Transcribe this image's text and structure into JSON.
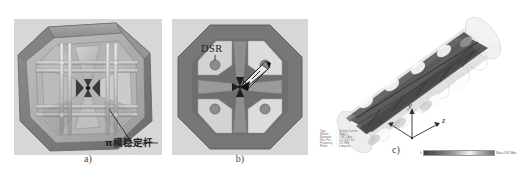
{
  "figure": {
    "top_artifact_text": "",
    "panels": [
      {
        "id": "a",
        "caption": "a)",
        "annotations": [
          {
            "name": "pi-mode-stabilizer-label",
            "text": "π模稳定杆"
          }
        ]
      },
      {
        "id": "b",
        "caption": "b)",
        "annotations": [
          {
            "name": "dsr-label",
            "text": "DSR"
          },
          {
            "name": "h-dimension-label",
            "text": "h"
          }
        ]
      },
      {
        "id": "c",
        "caption": "c)",
        "axes": {
          "x": "x",
          "y": "y",
          "z": "z"
        },
        "info_block": [
          {
            "key": "Type",
            "value": "Surface Current"
          },
          {
            "key": "Monitor",
            "value": "Mode 1"
          },
          {
            "key": "Maximum",
            "value": "1397.2 A/m"
          },
          {
            "key": "Max. Pos.",
            "value": "0.0 / 0.0 / 0.0"
          },
          {
            "key": "Frequency",
            "value": "325 MHz"
          },
          {
            "key": "Phase",
            "value": "0 degrees"
          }
        ],
        "colorbar": {
          "min_label": "0",
          "max_label": "Max=1397 A/m"
        }
      }
    ]
  }
}
